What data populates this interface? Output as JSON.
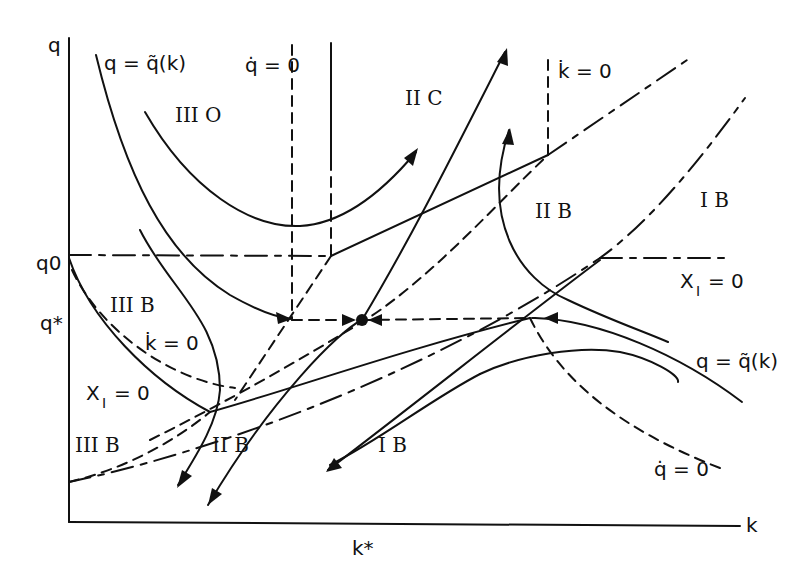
{
  "diagram": {
    "type": "phase-diagram",
    "axes": {
      "x_label": "k",
      "y_label": "q",
      "x_ticks": [
        "k*"
      ],
      "y_ticks": [
        "q0",
        "q*"
      ]
    },
    "curve_labels": {
      "q_tilde_top": "q = q̃(k)",
      "q_tilde_right": "q = q̃(k)",
      "qdot_top": "q̇ = 0",
      "qdot_bottom": "q̇ = 0",
      "kdot_top": "k̇ = 0",
      "kdot_left": "k̇ = 0",
      "xi_right": "X",
      "xi_right_sub": "I",
      "xi_right_eq": "= 0",
      "xi_left": "X",
      "xi_left_sub": "I",
      "xi_left_eq": "= 0"
    },
    "regions": {
      "r_IIIO": "III O",
      "r_IIC": "II C",
      "r_IIB_upper": "II B",
      "r_IB_upper": "I B",
      "r_IIIB_upper": "III B",
      "r_IIIB_lower": "III B",
      "r_IIB_lower": "II B",
      "r_IB_lower": "I B"
    },
    "equilibrium_point": "steady-state (k*, q*)"
  }
}
